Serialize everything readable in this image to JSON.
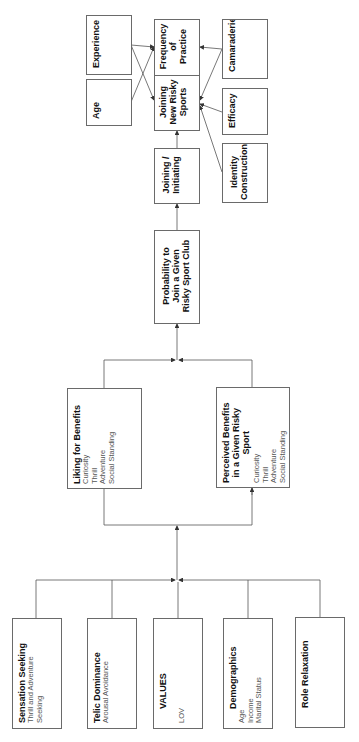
{
  "top_left": {
    "experience": "Experience",
    "age": "Age"
  },
  "outcomes": {
    "frequency": [
      "Frequency",
      "of",
      "Practice"
    ],
    "joining_new": [
      "Joining",
      "New Risky",
      "Sports"
    ]
  },
  "top_right": {
    "camaraderie": "Camaraderie",
    "efficacy": "Efficacy",
    "identity": [
      "Identity",
      "Construction"
    ]
  },
  "joining_initiating": [
    "Joining /",
    "Initiating"
  ],
  "probability": [
    "Probability to",
    "Join a Given",
    "Risky Sport Club"
  ],
  "liking": {
    "title": "Liking for Benefits",
    "items": [
      "Curiosity",
      "Thrill",
      "Adventure",
      "Social Standing"
    ]
  },
  "perceived": {
    "title": [
      "Perceived Benefits",
      "in a Given Risky",
      "Sport"
    ],
    "items": [
      "Curiosity",
      "Thrill",
      "Adventure",
      "Social Standing"
    ]
  },
  "antecedents": {
    "sensation": {
      "title": "Sensation Seeking",
      "items": [
        "Thrill and Adventure",
        "Seeking"
      ]
    },
    "telic": {
      "title": "Telic Dominance",
      "items": [
        "Arousal Avoidance"
      ]
    },
    "values": {
      "title": "VALUES",
      "items": [
        "LOV"
      ]
    },
    "demographics": {
      "title": "Demographics",
      "items": [
        "Age",
        "Income",
        "Marital Status"
      ]
    },
    "role": {
      "title": "Role Relaxation",
      "items": []
    }
  },
  "colors": {
    "line": "#555555",
    "border": "#6a6a6a",
    "subtext": "#555555"
  }
}
